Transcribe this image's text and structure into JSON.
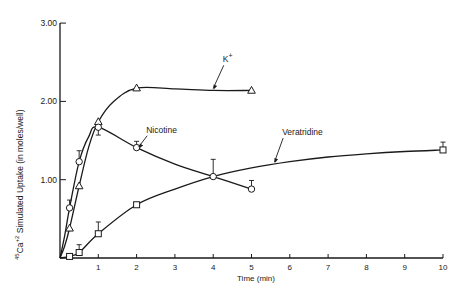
{
  "chart_data": {
    "type": "line",
    "title": "",
    "xlabel": "Time (min)",
    "ylabel": "45Ca+2 Simulated Uptake (in moles/well)",
    "ylabel_parts": {
      "iso": "45",
      "elem": "Ca",
      "charge": "+2",
      "rest": " Simulated Uptake (in moles/well)"
    },
    "xlim": [
      0,
      10
    ],
    "ylim": [
      0,
      3.0
    ],
    "xticks": [
      1,
      2,
      3,
      4,
      5,
      6,
      7,
      8,
      9,
      10
    ],
    "yticks": [
      {
        "value": 1.0,
        "label": "1.00"
      },
      {
        "value": 2.0,
        "label": "2.00"
      },
      {
        "value": 3.0,
        "label": "3.00"
      }
    ],
    "grid": false,
    "legend": "inline annotations",
    "series": [
      {
        "name": "K+",
        "label_main": "K",
        "label_sup": "+",
        "marker": "triangle",
        "x": [
          0,
          0.25,
          0.5,
          1,
          2,
          5
        ],
        "y": [
          0,
          0.38,
          0.92,
          1.74,
          2.17,
          2.14
        ],
        "err": [
          0,
          0,
          0,
          0,
          0,
          0
        ],
        "curve": [
          [
            0,
            0
          ],
          [
            0.12,
            0.15
          ],
          [
            0.25,
            0.38
          ],
          [
            0.5,
            0.92
          ],
          [
            0.75,
            1.42
          ],
          [
            1,
            1.74
          ],
          [
            1.4,
            2.0
          ],
          [
            2,
            2.17
          ],
          [
            3,
            2.16
          ],
          [
            4,
            2.14
          ],
          [
            5,
            2.14
          ]
        ],
        "label_pos": {
          "x": 4.25,
          "y": 2.5
        },
        "arrow_to": {
          "x": 4.0,
          "y": 2.14
        }
      },
      {
        "name": "Nicotine",
        "marker": "circle",
        "x": [
          0,
          0.25,
          0.5,
          1,
          2,
          4,
          5
        ],
        "y": [
          0,
          0.64,
          1.23,
          1.67,
          1.41,
          1.04,
          0.88
        ],
        "err": [
          0,
          0.1,
          0.14,
          0.1,
          0.08,
          0.22,
          0.11
        ],
        "err_dir": [
          1,
          1,
          1,
          -1,
          1,
          1,
          1
        ],
        "curve": [
          [
            0,
            0
          ],
          [
            0.12,
            0.28
          ],
          [
            0.25,
            0.64
          ],
          [
            0.5,
            1.23
          ],
          [
            0.75,
            1.55
          ],
          [
            1,
            1.67
          ],
          [
            2,
            1.41
          ],
          [
            3,
            1.2
          ],
          [
            4,
            1.04
          ],
          [
            5,
            0.88
          ]
        ],
        "label_pos": {
          "x": 2.25,
          "y": 1.6
        },
        "arrow_to": {
          "x": 2.05,
          "y": 1.39
        }
      },
      {
        "name": "Veratridine",
        "marker": "square",
        "x": [
          0,
          0.25,
          0.5,
          1,
          2,
          10
        ],
        "y": [
          0,
          0.02,
          0.07,
          0.31,
          0.68,
          1.38
        ],
        "err": [
          0,
          0,
          0.1,
          0.15,
          0.03,
          0.1
        ],
        "err_dir": [
          1,
          1,
          1,
          1,
          1,
          1
        ],
        "curve": [
          [
            0,
            0
          ],
          [
            0.25,
            0.02
          ],
          [
            0.5,
            0.07
          ],
          [
            1,
            0.31
          ],
          [
            2,
            0.68
          ],
          [
            3,
            0.88
          ],
          [
            4,
            1.04
          ],
          [
            5,
            1.15
          ],
          [
            6,
            1.23
          ],
          [
            7,
            1.29
          ],
          [
            8,
            1.33
          ],
          [
            9,
            1.36
          ],
          [
            10,
            1.38
          ]
        ],
        "label_pos": {
          "x": 5.8,
          "y": 1.57
        },
        "arrow_to": {
          "x": 5.6,
          "y": 1.2
        }
      }
    ]
  },
  "layout": {
    "plot_left": 60,
    "plot_bottom": 258,
    "px_per_x": 38.3,
    "px_per_y": 78.3,
    "ink": "#1a1a1a"
  }
}
